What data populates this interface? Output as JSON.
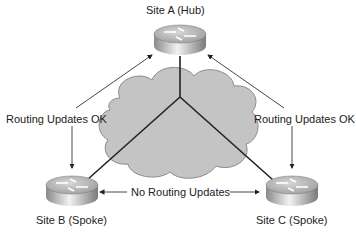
{
  "diagram": {
    "nodes": [
      {
        "id": "hub",
        "label": "Site A (Hub)",
        "type": "router"
      },
      {
        "id": "spokeB",
        "label": "Site B (Spoke)",
        "type": "router"
      },
      {
        "id": "spokeC",
        "label": "Site C (Spoke)",
        "type": "router"
      }
    ],
    "cloud": {
      "label": ""
    },
    "edges": [
      {
        "from": "hub",
        "to": "spokeB",
        "label": "Routing Updates OK",
        "style": "bidirectional-arrow"
      },
      {
        "from": "hub",
        "to": "spokeC",
        "label": "Routing Updates OK",
        "style": "bidirectional-arrow"
      },
      {
        "from": "spokeB",
        "to": "spokeC",
        "label": "No Routing Updates",
        "style": "bidirectional-arrow"
      }
    ],
    "labels": {
      "hub": "Site A (Hub)",
      "spoke_b": "Site B (Spoke)",
      "spoke_c": "Site C (Spoke)",
      "left_edge": "Routing Updates OK",
      "right_edge": "Routing Updates OK",
      "bottom_edge": "No Routing Updates"
    }
  }
}
